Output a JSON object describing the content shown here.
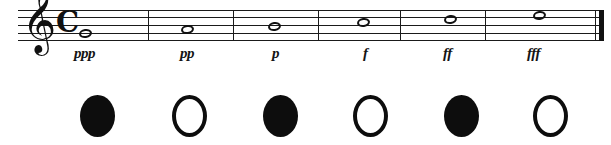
{
  "figure": {
    "background_color": "#ffffff",
    "ink_color": "#111111"
  },
  "staff": {
    "clef": "treble-clef",
    "clef_glyph": "𝄞",
    "time_signature": "common-time",
    "time_signature_glyph": "C",
    "line_count": 5,
    "final_barline": "thin-thick"
  },
  "measures": [
    {
      "index": 1,
      "note": "whole-note",
      "dynamic": "ppp",
      "dynamic_meaning": "pianississimo",
      "note_x": 79,
      "note_y": 29,
      "dynamic_x": 74,
      "barline_x": 148
    },
    {
      "index": 2,
      "note": "whole-note",
      "dynamic": "pp",
      "dynamic_meaning": "pianissimo",
      "note_x": 181,
      "note_y": 25,
      "dynamic_x": 180,
      "barline_x": 233
    },
    {
      "index": 3,
      "note": "whole-note",
      "dynamic": "p",
      "dynamic_meaning": "piano",
      "note_x": 268,
      "note_y": 22,
      "dynamic_x": 272,
      "barline_x": 318
    },
    {
      "index": 4,
      "note": "whole-note",
      "dynamic": "f",
      "dynamic_meaning": "forte",
      "note_x": 357,
      "note_y": 18,
      "dynamic_x": 363,
      "barline_x": 400
    },
    {
      "index": 5,
      "note": "whole-note",
      "dynamic": "ff",
      "dynamic_meaning": "fortissimo",
      "note_x": 444,
      "note_y": 15,
      "dynamic_x": 443,
      "barline_x": 485
    },
    {
      "index": 6,
      "note": "whole-note",
      "dynamic": "fff",
      "dynamic_meaning": "fortississimo",
      "note_x": 533,
      "note_y": 11,
      "dynamic_x": 527,
      "barline_x": null
    }
  ],
  "circle_row": [
    {
      "index": 1,
      "style": "filled",
      "x": 80
    },
    {
      "index": 2,
      "style": "hollow",
      "x": 172
    },
    {
      "index": 3,
      "style": "filled",
      "x": 263
    },
    {
      "index": 4,
      "style": "hollow",
      "x": 353
    },
    {
      "index": 5,
      "style": "filled",
      "x": 444
    },
    {
      "index": 6,
      "style": "hollow",
      "x": 533
    }
  ]
}
